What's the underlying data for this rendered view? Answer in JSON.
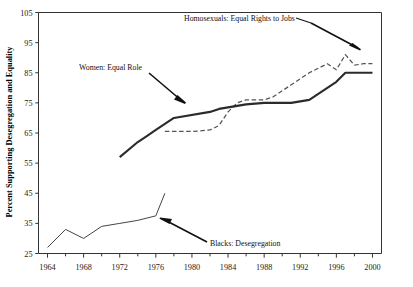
{
  "chart_data": {
    "type": "line",
    "title": "",
    "xlabel": "",
    "ylabel": "Percent Supporting Desegregation and Equality",
    "xlim": [
      1963,
      2001
    ],
    "ylim": [
      25,
      105
    ],
    "grid": false,
    "legend_position": "none",
    "yticks": [
      25,
      35,
      45,
      55,
      65,
      75,
      85,
      95,
      105
    ],
    "ytick_labels": [
      "25",
      "35",
      "45",
      "55",
      "65",
      "75",
      "85",
      "95",
      "105"
    ],
    "xticks": [
      1964,
      1968,
      1972,
      1976,
      1980,
      1984,
      1988,
      1992,
      1996,
      2000
    ],
    "xtick_labels": [
      "1964",
      "1968",
      "1972",
      "1976",
      "1980",
      "1984",
      "1988",
      "1992",
      "1996",
      "2000"
    ],
    "xminor_step": 2,
    "series": [
      {
        "name": "Women: Equal Role",
        "style": "solid",
        "color": "#2b2b2b",
        "x": [
          1972,
          1974,
          1975,
          1976,
          1977,
          1978,
          1982,
          1983,
          1984,
          1985,
          1986,
          1988,
          1989,
          1990,
          1991,
          1993,
          1994,
          1996,
          1997,
          1998,
          2000
        ],
        "y": [
          57,
          62,
          64,
          66,
          68,
          70,
          72,
          73,
          73.5,
          74,
          74.5,
          75,
          75,
          75,
          75,
          76,
          78,
          82,
          85,
          85,
          85
        ]
      },
      {
        "name": "Homosexuals: Equal Rights to Jobs",
        "style": "dashed",
        "color": "#555555",
        "x": [
          1977,
          1980,
          1982,
          1983,
          1984,
          1985,
          1986,
          1987,
          1988,
          1989,
          1990,
          1991,
          1992,
          1993,
          1994,
          1995,
          1996,
          1997,
          1998,
          1999,
          2000
        ],
        "y": [
          65.5,
          65.5,
          66,
          67.5,
          72,
          75,
          76,
          76,
          76,
          77,
          79,
          81,
          83,
          85,
          86.5,
          88,
          86,
          91,
          87.5,
          88,
          88
        ]
      },
      {
        "name": "Blacks: Desegregation",
        "style": "solid-thin",
        "color": "#444444",
        "x": [
          1964,
          1966,
          1968,
          1970,
          1972,
          1974,
          1976,
          1977
        ],
        "y": [
          27,
          33,
          30,
          34,
          35,
          36,
          37.5,
          45
        ]
      }
    ],
    "annotations": [
      {
        "text": "Homosexuals: Equal Rights to Jobs",
        "target_series": "Homosexuals: Equal Rights to Jobs",
        "target_x": 1997,
        "target_y": 91
      },
      {
        "text": "Women: Equal Role",
        "target_series": "Women: Equal Role",
        "target_x": 1982,
        "target_y": 72
      },
      {
        "text": "Blacks: Desegregation",
        "target_series": "Blacks: Desegregation",
        "target_x": 1977,
        "target_y": 45
      }
    ]
  }
}
